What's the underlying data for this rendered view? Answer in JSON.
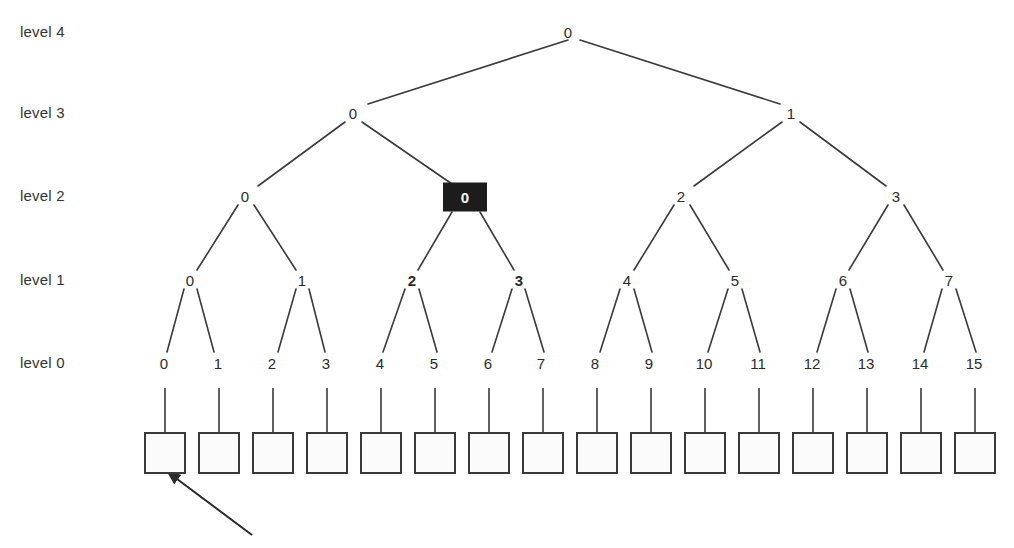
{
  "diagram": {
    "level_labels": [
      {
        "text": "level 4",
        "y": 32
      },
      {
        "text": "level 3",
        "y": 113
      },
      {
        "text": "level 2",
        "y": 196
      },
      {
        "text": "level 1",
        "y": 280
      },
      {
        "text": "level 0",
        "y": 363
      }
    ],
    "level_label_x": 20,
    "colors": {
      "line": "#3a3a3a",
      "text": "#2b2b2b",
      "highlight_fill": "#1c1c1c",
      "highlight_text": "#ffffff",
      "box_border": "#3a3a3a",
      "box_fill": "#fbfbfb",
      "background": "#ffffff"
    },
    "nodes": {
      "level4": [
        {
          "label": "0",
          "x": 568,
          "y": 32,
          "bold": false,
          "highlighted": false
        }
      ],
      "level3": [
        {
          "label": "0",
          "x": 353,
          "y": 113,
          "bold": false,
          "highlighted": false
        },
        {
          "label": "1",
          "x": 791,
          "y": 113,
          "bold": false,
          "highlighted": false
        }
      ],
      "level2": [
        {
          "label": "0",
          "x": 245,
          "y": 196,
          "bold": false,
          "highlighted": false
        },
        {
          "label": "0",
          "x": 465,
          "y": 197,
          "bold": true,
          "highlighted": true
        },
        {
          "label": "2",
          "x": 681,
          "y": 196,
          "bold": false,
          "highlighted": false
        },
        {
          "label": "3",
          "x": 896,
          "y": 196,
          "bold": false,
          "highlighted": false
        }
      ],
      "level1": [
        {
          "label": "0",
          "x": 190,
          "y": 280,
          "bold": false,
          "highlighted": false
        },
        {
          "label": "1",
          "x": 302,
          "y": 280,
          "bold": false,
          "highlighted": false
        },
        {
          "label": "2",
          "x": 412,
          "y": 280,
          "bold": true,
          "highlighted": false
        },
        {
          "label": "3",
          "x": 519,
          "y": 280,
          "bold": true,
          "highlighted": false
        },
        {
          "label": "4",
          "x": 627,
          "y": 280,
          "bold": false,
          "highlighted": false
        },
        {
          "label": "5",
          "x": 735,
          "y": 280,
          "bold": false,
          "highlighted": false
        },
        {
          "label": "6",
          "x": 843,
          "y": 280,
          "bold": false,
          "highlighted": false
        },
        {
          "label": "7",
          "x": 949,
          "y": 280,
          "bold": false,
          "highlighted": false
        }
      ],
      "level0": [
        {
          "label": "0",
          "x": 164,
          "y": 363
        },
        {
          "label": "1",
          "x": 218,
          "y": 363
        },
        {
          "label": "2",
          "x": 272,
          "y": 363
        },
        {
          "label": "3",
          "x": 326,
          "y": 363
        },
        {
          "label": "4",
          "x": 380,
          "y": 363
        },
        {
          "label": "5",
          "x": 434,
          "y": 363
        },
        {
          "label": "6",
          "x": 488,
          "y": 363
        },
        {
          "label": "7",
          "x": 541,
          "y": 363
        },
        {
          "label": "8",
          "x": 595,
          "y": 363
        },
        {
          "label": "9",
          "x": 649,
          "y": 363
        },
        {
          "label": "10",
          "x": 704,
          "y": 363
        },
        {
          "label": "11",
          "x": 758,
          "y": 363
        },
        {
          "label": "12",
          "x": 812,
          "y": 363
        },
        {
          "label": "13",
          "x": 866,
          "y": 363
        },
        {
          "label": "14",
          "x": 920,
          "y": 363
        },
        {
          "label": "15",
          "x": 974,
          "y": 363
        }
      ]
    },
    "edges": [
      {
        "x1": 568,
        "y1": 40,
        "x2": 368,
        "y2": 104
      },
      {
        "x1": 580,
        "y1": 40,
        "x2": 780,
        "y2": 104
      },
      {
        "x1": 345,
        "y1": 122,
        "x2": 258,
        "y2": 186
      },
      {
        "x1": 362,
        "y1": 122,
        "x2": 452,
        "y2": 184
      },
      {
        "x1": 782,
        "y1": 122,
        "x2": 694,
        "y2": 186
      },
      {
        "x1": 800,
        "y1": 122,
        "x2": 886,
        "y2": 186
      },
      {
        "x1": 238,
        "y1": 205,
        "x2": 197,
        "y2": 270
      },
      {
        "x1": 254,
        "y1": 205,
        "x2": 296,
        "y2": 270
      },
      {
        "x1": 452,
        "y1": 212,
        "x2": 418,
        "y2": 270
      },
      {
        "x1": 480,
        "y1": 212,
        "x2": 514,
        "y2": 270
      },
      {
        "x1": 674,
        "y1": 205,
        "x2": 634,
        "y2": 270
      },
      {
        "x1": 690,
        "y1": 205,
        "x2": 729,
        "y2": 270
      },
      {
        "x1": 888,
        "y1": 205,
        "x2": 849,
        "y2": 270
      },
      {
        "x1": 904,
        "y1": 205,
        "x2": 943,
        "y2": 270
      },
      {
        "x1": 184,
        "y1": 289,
        "x2": 167,
        "y2": 352
      },
      {
        "x1": 197,
        "y1": 289,
        "x2": 214,
        "y2": 352
      },
      {
        "x1": 296,
        "y1": 289,
        "x2": 278,
        "y2": 352
      },
      {
        "x1": 309,
        "y1": 289,
        "x2": 325,
        "y2": 352
      },
      {
        "x1": 405,
        "y1": 289,
        "x2": 383,
        "y2": 352
      },
      {
        "x1": 419,
        "y1": 289,
        "x2": 437,
        "y2": 352
      },
      {
        "x1": 512,
        "y1": 289,
        "x2": 492,
        "y2": 352
      },
      {
        "x1": 525,
        "y1": 289,
        "x2": 544,
        "y2": 352
      },
      {
        "x1": 620,
        "y1": 289,
        "x2": 600,
        "y2": 352
      },
      {
        "x1": 634,
        "y1": 289,
        "x2": 652,
        "y2": 352
      },
      {
        "x1": 728,
        "y1": 289,
        "x2": 708,
        "y2": 352
      },
      {
        "x1": 742,
        "y1": 289,
        "x2": 760,
        "y2": 352
      },
      {
        "x1": 836,
        "y1": 289,
        "x2": 817,
        "y2": 352
      },
      {
        "x1": 850,
        "y1": 289,
        "x2": 868,
        "y2": 352
      },
      {
        "x1": 942,
        "y1": 289,
        "x2": 924,
        "y2": 352
      },
      {
        "x1": 956,
        "y1": 289,
        "x2": 976,
        "y2": 352
      }
    ],
    "stems": [
      {
        "x": 165,
        "y1": 388,
        "y2": 432
      },
      {
        "x": 219,
        "y1": 388,
        "y2": 432
      },
      {
        "x": 273,
        "y1": 388,
        "y2": 432
      },
      {
        "x": 327,
        "y1": 388,
        "y2": 432
      },
      {
        "x": 381,
        "y1": 388,
        "y2": 432
      },
      {
        "x": 435,
        "y1": 388,
        "y2": 432
      },
      {
        "x": 489,
        "y1": 388,
        "y2": 432
      },
      {
        "x": 543,
        "y1": 388,
        "y2": 432
      },
      {
        "x": 597,
        "y1": 388,
        "y2": 432
      },
      {
        "x": 651,
        "y1": 388,
        "y2": 432
      },
      {
        "x": 705,
        "y1": 388,
        "y2": 432
      },
      {
        "x": 759,
        "y1": 388,
        "y2": 432
      },
      {
        "x": 813,
        "y1": 388,
        "y2": 432
      },
      {
        "x": 867,
        "y1": 388,
        "y2": 432
      },
      {
        "x": 921,
        "y1": 388,
        "y2": 432
      },
      {
        "x": 975,
        "y1": 388,
        "y2": 432
      }
    ],
    "leaf_boxes": [
      {
        "index": 0,
        "x": 144,
        "y": 432,
        "w": 42,
        "h": 42
      },
      {
        "index": 1,
        "x": 198,
        "y": 432,
        "w": 42,
        "h": 42
      },
      {
        "index": 2,
        "x": 252,
        "y": 432,
        "w": 42,
        "h": 42
      },
      {
        "index": 3,
        "x": 306,
        "y": 432,
        "w": 42,
        "h": 42
      },
      {
        "index": 4,
        "x": 360,
        "y": 432,
        "w": 42,
        "h": 42
      },
      {
        "index": 5,
        "x": 414,
        "y": 432,
        "w": 42,
        "h": 42
      },
      {
        "index": 6,
        "x": 468,
        "y": 432,
        "w": 42,
        "h": 42
      },
      {
        "index": 7,
        "x": 522,
        "y": 432,
        "w": 42,
        "h": 42
      },
      {
        "index": 8,
        "x": 576,
        "y": 432,
        "w": 42,
        "h": 42
      },
      {
        "index": 9,
        "x": 630,
        "y": 432,
        "w": 42,
        "h": 42
      },
      {
        "index": 10,
        "x": 684,
        "y": 432,
        "w": 42,
        "h": 42
      },
      {
        "index": 11,
        "x": 738,
        "y": 432,
        "w": 42,
        "h": 42
      },
      {
        "index": 12,
        "x": 792,
        "y": 432,
        "w": 42,
        "h": 42
      },
      {
        "index": 13,
        "x": 846,
        "y": 432,
        "w": 42,
        "h": 42
      },
      {
        "index": 14,
        "x": 900,
        "y": 432,
        "w": 42,
        "h": 42
      },
      {
        "index": 15,
        "x": 954,
        "y": 432,
        "w": 42,
        "h": 42
      }
    ],
    "annotation_arrow": {
      "from_x": 252,
      "from_y": 535,
      "to_x": 169,
      "to_y": 473
    }
  }
}
